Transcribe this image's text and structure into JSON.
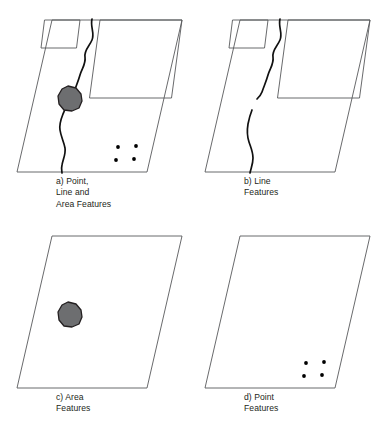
{
  "figure": {
    "background_color": "#ffffff",
    "panel_count": 4
  },
  "style": {
    "outline_stroke": "#58595b",
    "line_feature_color": "#111111",
    "area_fill_color": "#6d6e70",
    "area_stroke_color": "#231f20",
    "point_color": "#000000",
    "caption_color": "#231f20"
  },
  "panels": [
    {
      "id": "a",
      "caption_lines": [
        "a) Point,",
        "Line and",
        "Area Features"
      ],
      "shows_line": true,
      "shows_area": true,
      "shows_points": true,
      "shows_rectangles": true,
      "line_continuous": true
    },
    {
      "id": "b",
      "caption_lines": [
        "b) Line",
        "Features"
      ],
      "shows_line": true,
      "shows_area": false,
      "shows_points": false,
      "shows_rectangles": true,
      "line_continuous": false
    },
    {
      "id": "c",
      "caption_lines": [
        "c) Area",
        "Features"
      ],
      "shows_line": false,
      "shows_area": true,
      "shows_points": false,
      "shows_rectangles": false,
      "line_continuous": false
    },
    {
      "id": "d",
      "caption_lines": [
        "d) Point",
        "Features"
      ],
      "shows_line": false,
      "shows_area": false,
      "shows_points": true,
      "shows_rectangles": false,
      "line_continuous": false
    }
  ],
  "geometry": {
    "parallelogram_points": "52,20 182,20 147,172 17,172",
    "rect_small_points": "44.5,20 80,20 76.5,48 41,48",
    "rect_large_points": "100,20 182,20 171.5,98 89.5,98",
    "river_full_path": "M 92,19 C 90,27 95,33 92,40 C 89,47 84,50 85,57 C 86,64 82,68 80,75 C 78,82 76,86 74,92 C 72,97 70,99 68,102 C 66,106 65,110 63,114 C 61,119 59,124 60,130 C 61,137 64,142 65,148 C 66,154 63,159 62,165 C 61,169 62,171 62,173",
    "river_upper_path": "M 92,19 C 90,27 95,33 92,40 C 89,47 84,50 85,57 C 86,64 82,68 80,75 C 78,82 76,86 74,92 C 73,95 71,97 69,99",
    "river_lower_path": "M 64,110 C 62,115 61,119 60,124 C 59,130 59,136 61,142 C 63,148 65,152 65,158 C 65,164 63,168 62,173",
    "blob_points": "68,86 76,88 81,94 82,101 79,108 72,111 64,110 59,104 58,96 62,89",
    "points_xy": [
      [
        118,
        147
      ],
      [
        136,
        146
      ],
      [
        116,
        160
      ],
      [
        134,
        159
      ]
    ],
    "point_radius": 1.9
  }
}
